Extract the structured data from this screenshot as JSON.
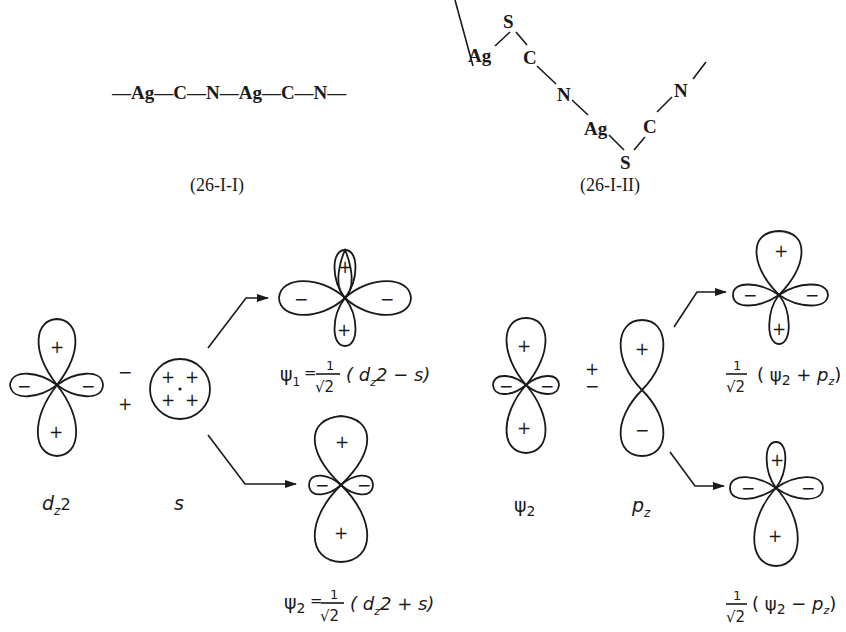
{
  "structures": {
    "linear": {
      "chain": "—Ag—C—N—Ag—C—N—",
      "caption": "(26-I-I)"
    },
    "zigzag": {
      "atoms": [
        "Ag",
        "S",
        "C",
        "N",
        "Ag",
        "S",
        "C",
        "N"
      ],
      "caption": "(26-I-II)"
    }
  },
  "left_panel": {
    "dz2": {
      "label": "d",
      "sub": "z",
      "tail": "2",
      "signs": {
        "top": "+",
        "bottom": "+",
        "left": "−",
        "right": "−"
      }
    },
    "operator": {
      "top": "−",
      "bottom": "+"
    },
    "s": {
      "label": "s",
      "signs": [
        "+",
        "+",
        "+",
        "+"
      ]
    },
    "psi1": {
      "signs": {
        "top": "+",
        "bottom": "+",
        "left": "−",
        "right": "−"
      },
      "eq_lhs": "ψ",
      "eq_lhs_sub": "1",
      "eq_equals": "=",
      "frac_num": "1",
      "frac_den": "√2",
      "eq_rhs": "( d",
      "eq_rhs_sub": "z",
      "eq_rhs_tail": "2 − s)"
    },
    "psi2": {
      "signs": {
        "top": "+",
        "bottom": "+",
        "left": "−",
        "right": "−"
      },
      "eq_lhs": "ψ",
      "eq_lhs_sub": "2",
      "eq_equals": "=",
      "frac_num": "1",
      "frac_den": "√2",
      "eq_rhs": "( d",
      "eq_rhs_sub": "z",
      "eq_rhs_tail": "2 + s)"
    }
  },
  "right_panel": {
    "psi2": {
      "label": "ψ",
      "sub": "2",
      "signs": {
        "top": "+",
        "bottom": "+",
        "left": "−",
        "right": "−"
      }
    },
    "operator": {
      "top": "+",
      "bottom": "−"
    },
    "pz": {
      "label": "p",
      "sub": "z",
      "signs": {
        "top": "+",
        "bottom": "−"
      }
    },
    "sum": {
      "signs": {
        "top": "+",
        "bottom": "+",
        "left": "−",
        "right": "−"
      },
      "frac_num": "1",
      "frac_den": "√2",
      "expr": "( ψ",
      "expr_sub": "2",
      "expr_tail": " + p",
      "expr_sub2": "z",
      "expr_close": ")"
    },
    "diff": {
      "signs": {
        "top": "+",
        "bottom": "+",
        "left": "−",
        "right": "−"
      },
      "frac_num": "1",
      "frac_den": "√2",
      "expr": "( ψ",
      "expr_sub": "2",
      "expr_tail": " − p",
      "expr_sub2": "z",
      "expr_close": ")"
    }
  }
}
